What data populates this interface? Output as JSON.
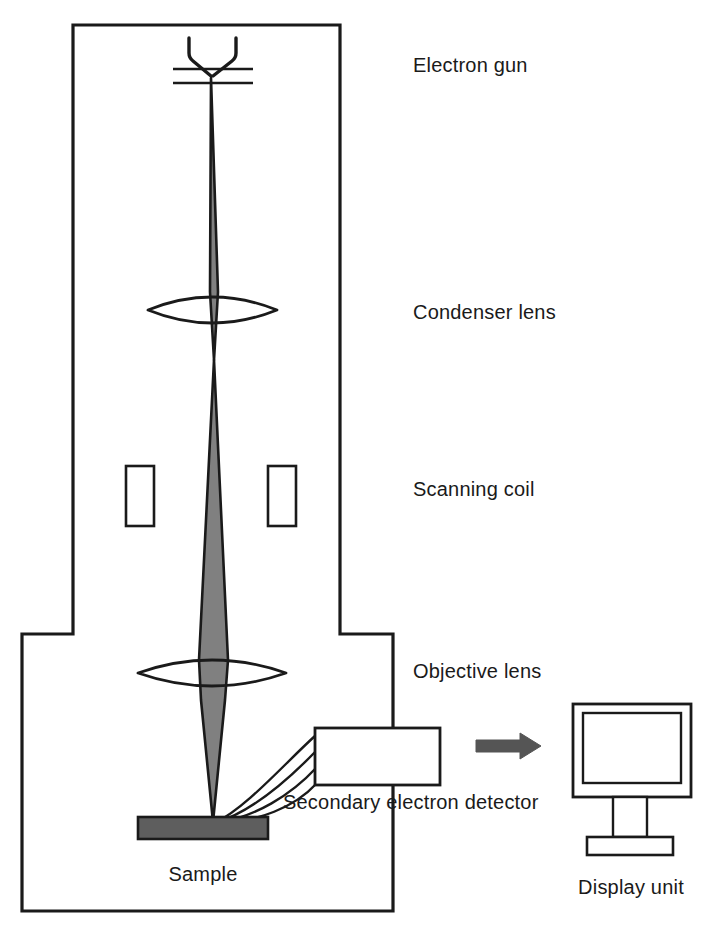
{
  "figure": {
    "type": "schematic-diagram"
  },
  "colors": {
    "outline": "#1a1a1a",
    "beam_fill": "#808080",
    "sample_fill": "#5e5e5e",
    "arrow_fill": "#555555",
    "background": "#ffffff",
    "text": "#1a1a1a"
  },
  "labels": {
    "electron_gun": "Electron gun",
    "condenser_lens": "Condenser lens",
    "scanning_coil": "Scanning coil",
    "objective_lens": "Objective lens",
    "secondary_electron_detector": "Secondary electron detector",
    "sample": "Sample",
    "display_unit": "Display unit"
  },
  "components": {
    "vacuum_chamber": {
      "name": "vacuum column and chamber outline"
    },
    "electron_gun": {
      "name": "filament and anode plates"
    },
    "electron_beam": {
      "name": "electron beam path"
    },
    "condenser_lens": {
      "name": "condenser lens element"
    },
    "scanning_coil_left": {
      "name": "left scanning coil"
    },
    "scanning_coil_right": {
      "name": "right scanning coil"
    },
    "objective_lens": {
      "name": "objective lens element"
    },
    "secondary_electrons": {
      "name": "secondary electron trajectories",
      "count": 4
    },
    "detector_box": {
      "name": "secondary electron detector body"
    },
    "sample_stage": {
      "name": "sample specimen block"
    },
    "signal_arrow": {
      "name": "signal flow arrow"
    },
    "display_unit": {
      "name": "CRT display monitor"
    }
  }
}
